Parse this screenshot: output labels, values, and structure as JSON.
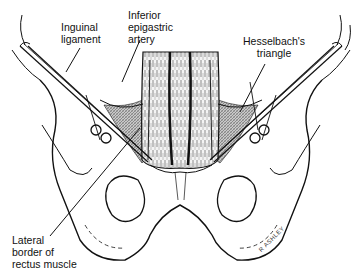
{
  "figure": {
    "labels": {
      "inguinal_ligament": {
        "line1": "Inguinal",
        "line2": "ligament"
      },
      "inferior_epigastric_artery": {
        "line1": "Inferior",
        "line2": "epigastric",
        "line3": "artery"
      },
      "hesselbachs_triangle": {
        "line1": "Hesselbach's",
        "line2": "triangle"
      },
      "lateral_border_rectus": {
        "line1": "Lateral",
        "line2": "border of",
        "line3": "rectus muscle"
      }
    },
    "signature": "R ASHLEY",
    "colors": {
      "line": "#111111",
      "shading": "#8a8a8a",
      "background": "#ffffff"
    }
  }
}
